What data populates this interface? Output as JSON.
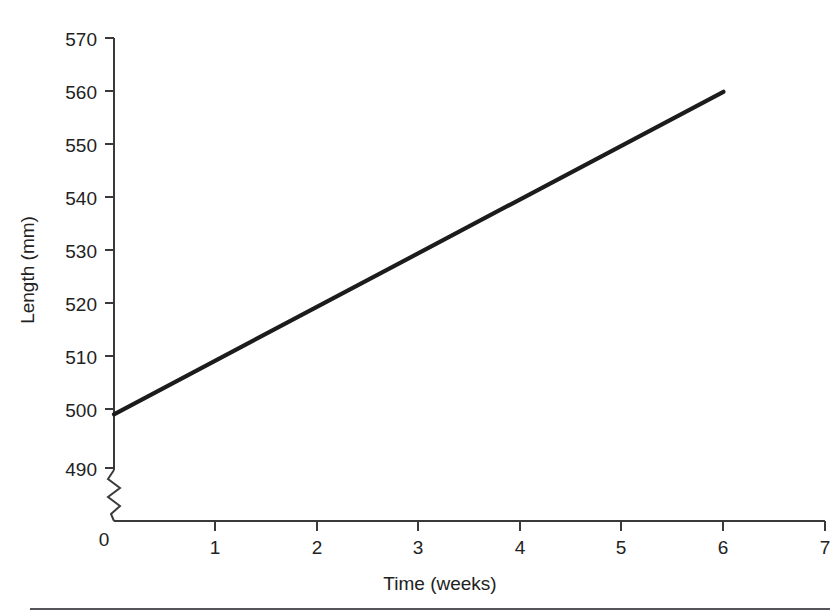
{
  "chart_data": {
    "type": "line",
    "title": "",
    "subtitle": "",
    "xlabel": "Time (weeks)",
    "ylabel": "Length (mm)",
    "x": [
      0,
      6
    ],
    "values": [
      500,
      560
    ],
    "series": [
      {
        "name": "Length",
        "x": [
          0,
          6
        ],
        "values": [
          500,
          560
        ],
        "color": "#1c1c1c"
      }
    ],
    "xlim": [
      0,
      7
    ],
    "ylim": [
      490,
      570
    ],
    "xticks": [
      0,
      1,
      2,
      3,
      4,
      5,
      6,
      7
    ],
    "xtick_labels": [
      "0",
      "1",
      "2",
      "3",
      "4",
      "5",
      "6",
      "7"
    ],
    "yticks": [
      490,
      500,
      510,
      520,
      530,
      540,
      550,
      560,
      570
    ],
    "ytick_labels": [
      "490",
      "500",
      "510",
      "520",
      "530",
      "540",
      "550",
      "560",
      "570"
    ],
    "y_axis_break": true,
    "y_axis_break_label": "0",
    "grid": false,
    "legend": false,
    "legend_position": "none",
    "annotations": []
  },
  "axes": {
    "x_title": "Time (weeks)",
    "y_title": "Length (mm)",
    "origin_label": "0"
  },
  "colors": {
    "background": "#ffffff",
    "axis": "#3a3a3a",
    "line": "#1c1c1c",
    "text": "#222222",
    "footer_rule": "#55555a"
  }
}
